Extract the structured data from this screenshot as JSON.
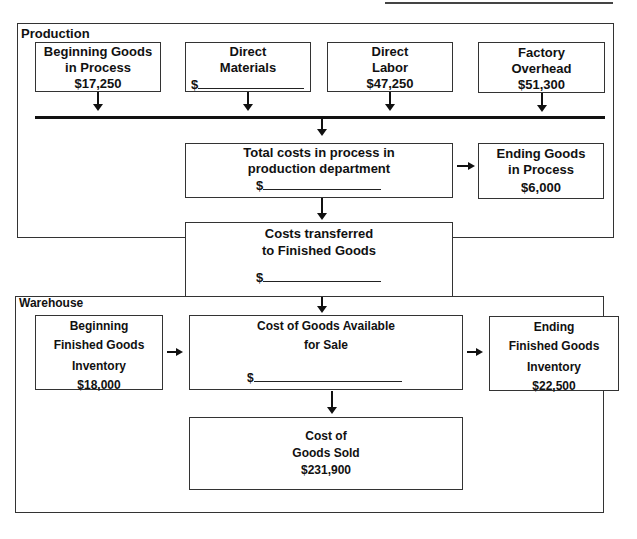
{
  "regions": {
    "production": "Production",
    "warehouse": "Warehouse"
  },
  "production": {
    "beginning_goods_in_process": {
      "line1": "Beginning Goods",
      "line2": "in Process",
      "value": "$17,250"
    },
    "direct_materials": {
      "line1": "Direct",
      "line2": "Materials",
      "value_prefix": "$"
    },
    "direct_labor": {
      "line1": "Direct",
      "line2": "Labor",
      "value": "$47,250"
    },
    "factory_overhead": {
      "line1": "Factory",
      "line2": "Overhead",
      "value": "$51,300"
    },
    "total_costs_in_process": {
      "line1": "Total costs in process in",
      "line2": "production department",
      "value_prefix": "$"
    },
    "ending_goods_in_process": {
      "line1": "Ending Goods",
      "line2": "in Process",
      "value": "$6,000"
    }
  },
  "transfer": {
    "costs_transferred": {
      "line1": "Costs transferred",
      "line2": "to Finished Goods",
      "value_prefix": "$"
    }
  },
  "warehouse": {
    "beginning_finished_goods": {
      "line1": "Beginning",
      "line2": "Finished Goods",
      "line3": "Inventory",
      "value": "$18,000"
    },
    "cost_of_goods_available": {
      "line1": "Cost of Goods Available",
      "line2": "for Sale",
      "value_prefix": "$"
    },
    "ending_finished_goods": {
      "line1": "Ending",
      "line2": "Finished Goods",
      "line3": "Inventory",
      "value": "$22,500"
    },
    "cost_of_goods_sold": {
      "line1": "Cost of",
      "line2": "Goods Sold",
      "value": "$231,900"
    }
  }
}
